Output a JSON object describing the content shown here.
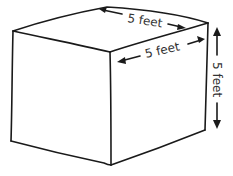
{
  "diagram": {
    "type": "cube",
    "labels": {
      "top_depth": "5 feet",
      "front_width": "5 feet",
      "height": "5 feet"
    },
    "colors": {
      "stroke": "#1a1a1a",
      "text": "#333333",
      "background": "#ffffff"
    }
  }
}
